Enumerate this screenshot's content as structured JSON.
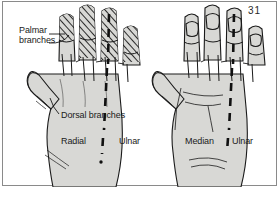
{
  "figure": {
    "plate_number": "31",
    "background_color": "#ffffff",
    "border_color": "#8a8a8a",
    "skin_fill_color": "#d8d8d5",
    "ink_color": "#1a1a1a"
  },
  "labels": {
    "palmar_branches_line1": "Palmar",
    "palmar_branches_line2": "branches",
    "dorsal_branches": "Dorsal branches",
    "radial": "Radial",
    "ulnar_left": "Ulnar",
    "median": "Median",
    "ulnar_right": "Ulnar"
  },
  "hands": [
    {
      "name": "left-hand-dorsal-view",
      "view": "dorsal",
      "territories": [
        "Radial",
        "Ulnar"
      ],
      "hatched_region": "palmar branches extending onto dorsal fingertips",
      "divider": "dashed vertical line"
    },
    {
      "name": "right-hand-palmar-view",
      "view": "palmar",
      "territories": [
        "Median",
        "Ulnar"
      ],
      "hatched_region": "none",
      "divider": "dashed vertical line"
    }
  ]
}
